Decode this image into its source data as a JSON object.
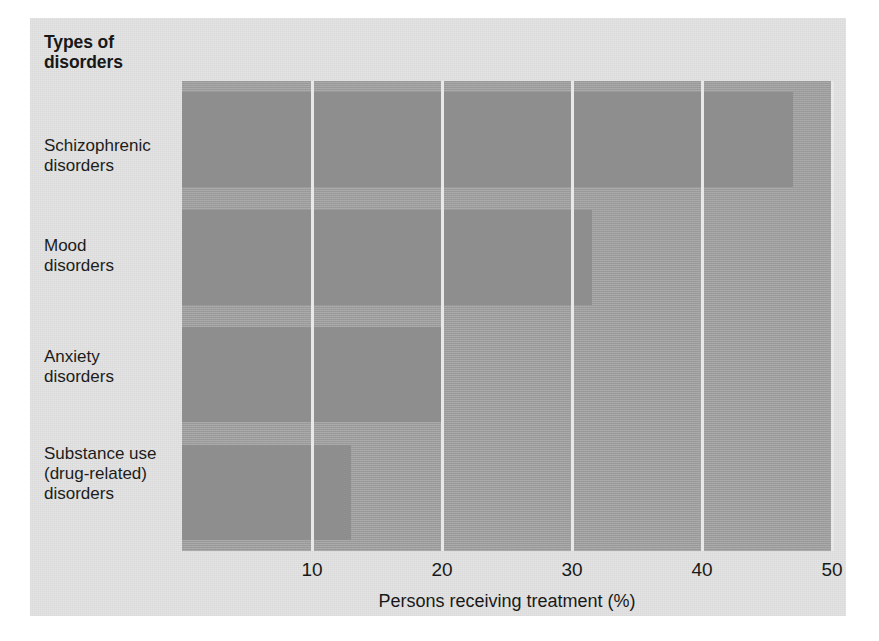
{
  "figure": {
    "category_axis_heading": "Types of disorders",
    "background_color": "#e3e3e3",
    "plot_background_color": "#a7a7a7",
    "bar_color": "#8e8e8e",
    "gridline_color": "#e8e8e8"
  },
  "chart_data": {
    "type": "bar",
    "orientation": "horizontal",
    "title": "Types of disorders",
    "xlabel": "Persons receiving treatment (%)",
    "ylabel": "Types of disorders",
    "categories": [
      "Schizophrenic disorders",
      "Mood disorders",
      "Anxiety disorders",
      "Substance use (drug-related) disorders"
    ],
    "category_lines": [
      [
        "Schizophrenic",
        "disorders"
      ],
      [
        "Mood",
        "disorders"
      ],
      [
        "Anxiety",
        "disorders"
      ],
      [
        "Substance use",
        "(drug-related)",
        "disorders"
      ]
    ],
    "values": [
      47,
      31.5,
      20,
      13
    ],
    "xlim": [
      0,
      50
    ],
    "xticks": [
      10,
      20,
      30,
      40,
      50
    ],
    "xtick_labels": [
      "10",
      "20",
      "30",
      "40",
      "50"
    ],
    "grid": true,
    "grid_axis": "x",
    "legend": false
  }
}
